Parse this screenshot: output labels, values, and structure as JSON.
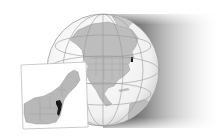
{
  "map": {
    "type": "locator-map",
    "globe": {
      "region_shown": "North America",
      "center": [
        103,
        70
      ],
      "radius": 56,
      "ocean_color": "#f4f4f4",
      "land_color": "#bdbdbd",
      "graticule_color": "#9a9a9a",
      "shadow_color": "#222222"
    },
    "inset": {
      "region_shown": "Northeastern United States",
      "highlighted_state": "New Jersey",
      "highlight_color": "#1a1a1a",
      "land_color": "#b8b8b8",
      "frame_color": "#bdbdbd"
    }
  }
}
